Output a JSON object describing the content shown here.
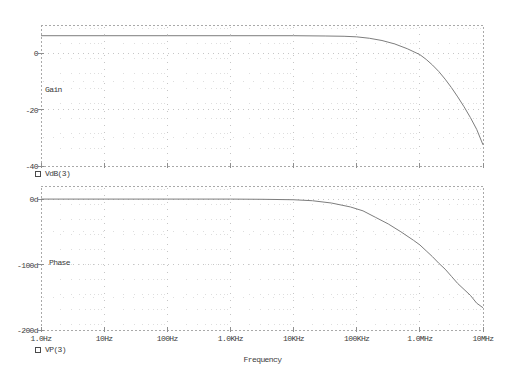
{
  "window": {
    "background": "#ffffff",
    "width": 506,
    "height": 376
  },
  "colors": {
    "curve": "#7d7d7d",
    "border": "#a9a9a9",
    "grid_major": "#c6c6c6",
    "grid_minor": "#dedede",
    "tick_mark": "#8f8f8f",
    "text": "#3c3c3c"
  },
  "frequency_axis": {
    "label": "Frequency",
    "tick_labels": [
      "1.0Hz",
      "10Hz",
      "100Hz",
      "1.0KHz",
      "10KHz",
      "100KHz",
      "1.0MHz",
      "10MHz"
    ],
    "log10_range": [
      0,
      7
    ],
    "scale": "log10"
  },
  "chart_data": [
    {
      "type": "line",
      "panel_label": "Gain",
      "ylabel_ticks": [
        "0",
        "-20",
        "-40"
      ],
      "yticks": [
        0,
        -20,
        -40
      ],
      "ylim": [
        10,
        -40
      ],
      "y_unit": "dB",
      "grid": "dotted",
      "legend": {
        "marker": "open-square",
        "label": "VdB(3)",
        "position": "below-left"
      },
      "x_unit": "Hz",
      "x_scale": "log10",
      "x_log10": [
        0,
        1,
        2,
        3,
        4,
        4.5,
        4.8,
        5.0,
        5.2,
        5.4,
        5.6,
        5.8,
        6.0,
        6.1,
        6.2,
        6.3,
        6.4,
        6.5,
        6.6,
        6.7,
        6.8,
        6.9,
        7.0
      ],
      "values": [
        6.2,
        6.2,
        6.2,
        6.2,
        6.2,
        6.1,
        6.0,
        5.8,
        5.3,
        4.5,
        3.3,
        1.6,
        -0.5,
        -2.2,
        -4.2,
        -6.5,
        -9.2,
        -12.2,
        -15.5,
        -19.0,
        -22.8,
        -27.0,
        -32.5
      ]
    },
    {
      "type": "line",
      "panel_label": "Phase",
      "ylabel_ticks": [
        "0d",
        "-100d",
        "-200d"
      ],
      "yticks": [
        0,
        -100,
        -200
      ],
      "ylim": [
        20,
        -200
      ],
      "y_unit": "deg",
      "grid": "dotted",
      "legend": {
        "marker": "open-square",
        "label": "VP(3)",
        "position": "below-left"
      },
      "x_unit": "Hz",
      "x_scale": "log10",
      "x_log10": [
        0,
        1,
        2,
        3,
        3.5,
        4,
        4.3,
        4.6,
        4.9,
        5.1,
        5.3,
        5.5,
        5.7,
        5.9,
        6.0,
        6.1,
        6.2,
        6.3,
        6.4,
        6.5,
        6.6,
        6.7,
        6.8,
        6.9,
        7.0
      ],
      "values": [
        0,
        0,
        0,
        0,
        -0.3,
        -1,
        -2.5,
        -6,
        -12,
        -18,
        -28,
        -38,
        -50,
        -63,
        -70,
        -79,
        -88,
        -98,
        -107,
        -118,
        -129,
        -138,
        -147,
        -159,
        -166
      ]
    }
  ]
}
